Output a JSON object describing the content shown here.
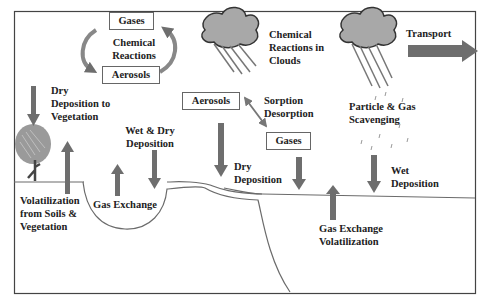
{
  "diagram": {
    "colors": {
      "arrow": "#6e6e6e",
      "frame": "#444444",
      "cloud": "#a8a8a8",
      "text": "#222222"
    },
    "boxes": {
      "gases_top": "Gases",
      "aerosols_top": "Aerosols",
      "aerosols_mid": "Aerosols",
      "gases_mid": "Gases"
    },
    "labels": {
      "chemical_reactions": [
        "Chemical",
        "Reactions"
      ],
      "chemical_reactions_clouds": [
        "Chemical",
        "Reactions in",
        "Clouds"
      ],
      "transport": "Transport",
      "dry_deposition_vegetation": [
        "Dry",
        "Deposition to",
        "Vegetation"
      ],
      "wet_dry_deposition": [
        "Wet & Dry",
        "Deposition"
      ],
      "sorption_desorption": [
        "Sorption",
        "Desorption"
      ],
      "particle_gas_scavenging": [
        "Particle & Gas",
        "Scavenging"
      ],
      "dry_deposition": [
        "Dry",
        "Deposition"
      ],
      "wet_deposition": [
        "Wet",
        "Deposition"
      ],
      "volatilization_soils": [
        "Volatilization",
        "from Soils &",
        "Vegetation"
      ],
      "gas_exchange_lake": "Gas Exchange",
      "gas_exchange_volatilization": [
        "Gas Exchange",
        "Volatilization"
      ]
    }
  }
}
